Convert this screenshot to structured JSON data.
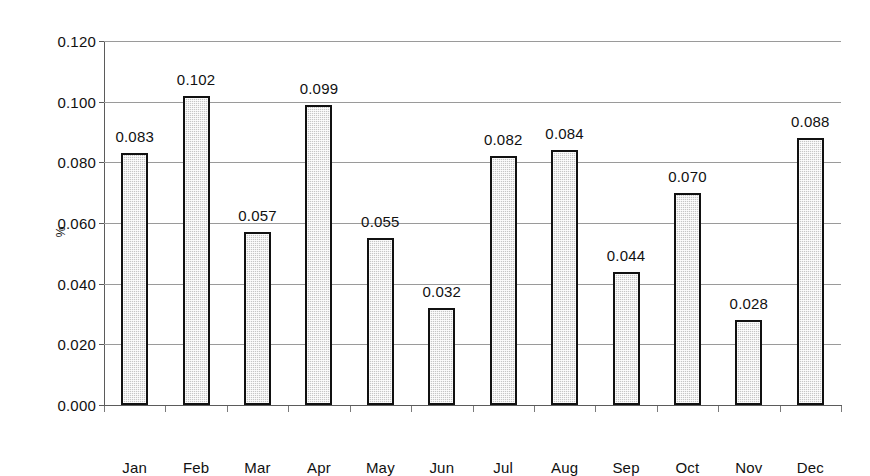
{
  "chart_data": {
    "type": "bar",
    "title": "",
    "subtitle": "",
    "xlabel": "",
    "ylabel": "%",
    "categories": [
      "Jan",
      "Feb",
      "Mar",
      "Apr",
      "May",
      "Jun",
      "Jul",
      "Aug",
      "Sep",
      "Oct",
      "Nov",
      "Dec"
    ],
    "values": [
      0.083,
      0.102,
      0.057,
      0.099,
      0.055,
      0.032,
      0.082,
      0.084,
      0.044,
      0.07,
      0.028,
      0.088
    ],
    "data_labels": [
      "0.083",
      "0.102",
      "0.057",
      "0.099",
      "0.055",
      "0.032",
      "0.082",
      "0.084",
      "0.044",
      "0.070",
      "0.028",
      "0.088"
    ],
    "ylim": [
      0.0,
      0.12
    ],
    "ytick_values": [
      0.0,
      0.02,
      0.04,
      0.06,
      0.08,
      0.1,
      0.12
    ],
    "ytick_labels": [
      "0.000",
      "0.020",
      "0.040",
      "0.060",
      "0.080",
      "0.100",
      "0.120"
    ],
    "grid": true,
    "grid_axis": "y",
    "legend": false,
    "legend_position": "none",
    "series": [
      {
        "name": "%",
        "values": [
          0.083,
          0.102,
          0.057,
          0.099,
          0.055,
          0.032,
          0.082,
          0.084,
          0.044,
          0.07,
          0.028,
          0.088
        ]
      }
    ],
    "colors": {
      "bar_fill": "#c6c6c6",
      "bar_border": "#111111",
      "gridline": "#9a9a9a",
      "axis": "#5b5b5b",
      "text": "#111111",
      "background": "#ffffff"
    }
  }
}
